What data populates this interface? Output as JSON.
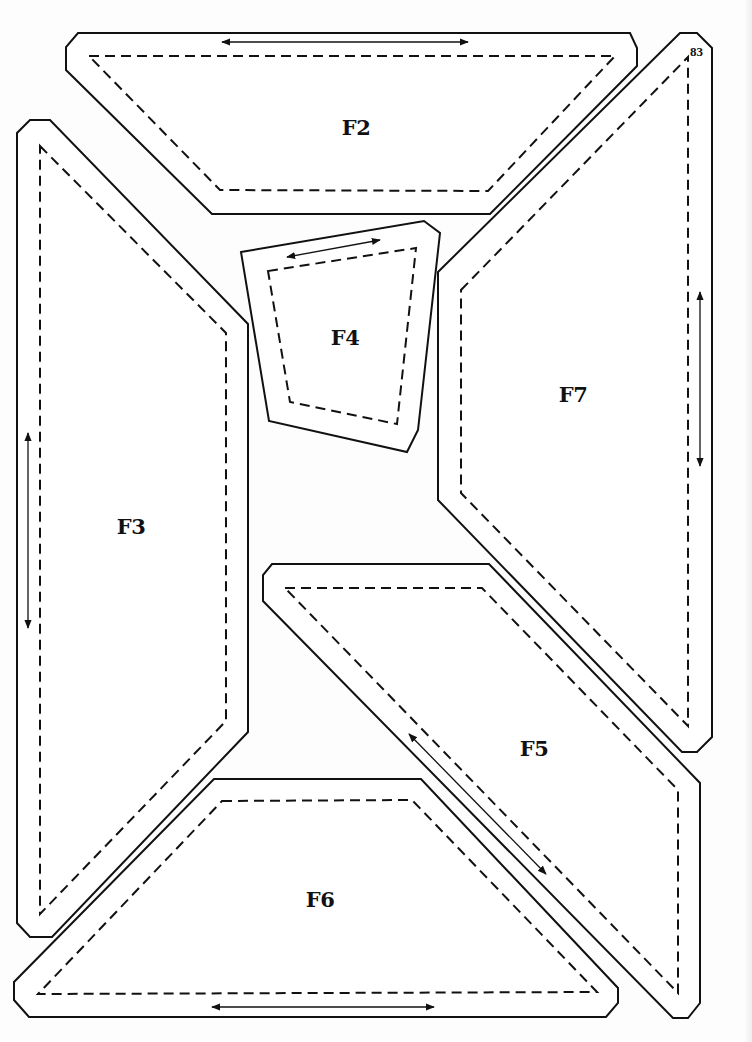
{
  "page": {
    "number": "83",
    "type": "pattern template sheet"
  },
  "pieces": [
    {
      "id": "F2",
      "label": "F2",
      "grainline": "horizontal"
    },
    {
      "id": "F3",
      "label": "F3",
      "grainline": "vertical"
    },
    {
      "id": "F4",
      "label": "F4",
      "grainline": "diagonal"
    },
    {
      "id": "F5",
      "label": "F5",
      "grainline": "diagonal"
    },
    {
      "id": "F6",
      "label": "F6",
      "grainline": "horizontal"
    },
    {
      "id": "F7",
      "label": "F7",
      "grainline": "vertical"
    }
  ],
  "legend": {
    "solid_line": "cutting line",
    "dashed_line": "sewing line",
    "arrow": "grainline"
  },
  "colors": {
    "ink": "#111111",
    "paper": "#fdfdfd"
  }
}
